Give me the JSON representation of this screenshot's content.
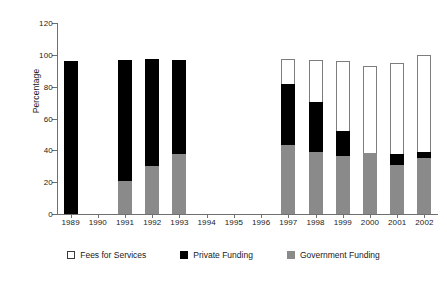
{
  "chart_data": {
    "type": "bar",
    "title": "",
    "subtitle": "",
    "xlabel": "",
    "ylabel": "Percentage",
    "ylim": [
      0,
      120
    ],
    "yticks": [
      0,
      20,
      40,
      60,
      80,
      100,
      120
    ],
    "grid": false,
    "stacked": true,
    "legend_position": "bottom",
    "categories": [
      "1989",
      "1990",
      "1991",
      "1992",
      "1993",
      "1994",
      "1995",
      "1996",
      "1997",
      "1998",
      "1999",
      "2000",
      "2001",
      "2002"
    ],
    "series": [
      {
        "name": "Government Funding",
        "color": "#8a8a8a",
        "values": [
          0,
          null,
          21,
          30,
          37.5,
          null,
          null,
          null,
          43.5,
          39,
          36.5,
          38.5,
          31,
          35.5
        ]
      },
      {
        "name": "Private Funding",
        "color": "#000000",
        "values": [
          96,
          null,
          75.5,
          67.5,
          59.5,
          null,
          null,
          null,
          38.5,
          31.5,
          15.5,
          0,
          6.5,
          3.5
        ]
      },
      {
        "name": "Fees for Services",
        "color": "#ffffff",
        "values": [
          0,
          null,
          0,
          0,
          0,
          null,
          null,
          null,
          15.5,
          26.5,
          44,
          54.5,
          57.5,
          61
        ]
      }
    ],
    "bar_totals": [
      96,
      null,
      96.5,
      97.5,
      97,
      null,
      null,
      null,
      97.5,
      97,
      96,
      93,
      95,
      100
    ],
    "missing_years": [
      "1990",
      "1994",
      "1995",
      "1996"
    ]
  },
  "legend": {
    "items": [
      {
        "label": "Fees for Services",
        "swatch": "white-square-icon"
      },
      {
        "label": "Private Funding",
        "swatch": "black-square-icon"
      },
      {
        "label": "Government Funding",
        "swatch": "gray-square-icon"
      }
    ]
  }
}
